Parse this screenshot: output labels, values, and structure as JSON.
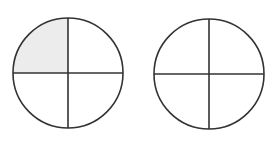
{
  "diagram": {
    "type": "fraction-circles",
    "circles": [
      {
        "name": "left-circle",
        "cx": 68,
        "cy": 73,
        "r": 55,
        "parts": 4,
        "shaded_quadrants": [
          "top-left"
        ],
        "fraction_shaded": "1/4"
      },
      {
        "name": "right-circle",
        "cx": 209,
        "cy": 74,
        "r": 55,
        "parts": 4,
        "shaded_quadrants": [],
        "fraction_shaded": "0/4"
      }
    ],
    "colors": {
      "stroke": "#333333",
      "shade": "#ececec",
      "background": "#ffffff"
    }
  }
}
